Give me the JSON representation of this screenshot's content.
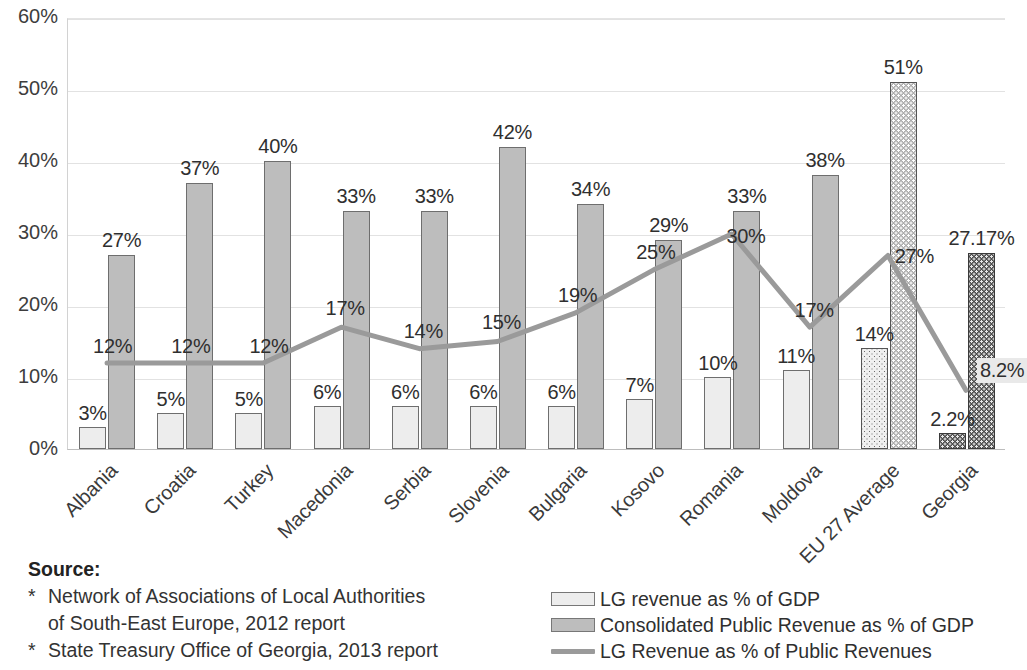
{
  "chart_data": {
    "type": "bar",
    "title": "",
    "xlabel": "",
    "ylabel": "",
    "ylim": [
      0,
      60
    ],
    "ytick_labels": [
      "60%",
      "50%",
      "40%",
      "30%",
      "20%",
      "10%",
      "0%"
    ],
    "ytick_values": [
      60,
      50,
      40,
      30,
      20,
      10,
      0
    ],
    "grid": true,
    "legend_position": "bottom-right",
    "categories": [
      "Albania",
      "Croatia",
      "Turkey",
      "Macedonia",
      "Serbia",
      "Slovenia",
      "Bulgaria",
      "Kosovo",
      "Romania",
      "Moldova",
      "EU 27 Average",
      "Georgia"
    ],
    "series": [
      {
        "name": "LG revenue as % of GDP",
        "type": "bar",
        "values": [
          3,
          5,
          5,
          6,
          6,
          6,
          6,
          7,
          10,
          11,
          14,
          2.2
        ],
        "labels": [
          "3%",
          "5%",
          "5%",
          "6%",
          "6%",
          "6%",
          "6%",
          "7%",
          "10%",
          "11%",
          "14%",
          "2.2%"
        ]
      },
      {
        "name": "Consolidated Public Revenue as % of GDP",
        "type": "bar",
        "values": [
          27,
          37,
          40,
          33,
          33,
          42,
          34,
          29,
          33,
          38,
          51,
          27.17
        ],
        "labels": [
          "27%",
          "37%",
          "40%",
          "33%",
          "33%",
          "42%",
          "34%",
          "29%",
          "33%",
          "38%",
          "51%",
          "27.17%"
        ]
      },
      {
        "name": "LG Revenue as % of Public Revenues",
        "type": "line",
        "values": [
          12,
          12,
          12,
          17,
          14,
          15,
          19,
          25,
          30,
          17,
          27,
          8.2
        ],
        "labels": [
          "12%",
          "12%",
          "12%",
          "17%",
          "14%",
          "15%",
          "19%",
          "25%",
          "30%",
          "17%",
          "27%",
          "8.2%"
        ]
      }
    ],
    "colors": {
      "series1_fill": "#ededed",
      "series2_fill": "#bdbdbd",
      "line": "#9a9a9a",
      "pattern_dark_fill": "#4d4d4d",
      "grid": "#e2e2e2",
      "text": "#3b3b3b"
    }
  },
  "legend": {
    "entries": [
      {
        "label": "LG revenue as % of GDP",
        "marker": "swatch-light"
      },
      {
        "label": "Consolidated Public Revenue as % of GDP",
        "marker": "swatch-mid"
      },
      {
        "label": "LG Revenue as % of Public Revenues",
        "marker": "line-gray"
      }
    ]
  },
  "source": {
    "title": "Source:",
    "bullet": "*",
    "items": [
      {
        "line1": "Network of Associations of Local Authorities",
        "line2": "of South-East Europe, 2012 report"
      },
      {
        "line1": "State Treasury Office of Georgia, 2013 report",
        "line2": ""
      }
    ]
  }
}
